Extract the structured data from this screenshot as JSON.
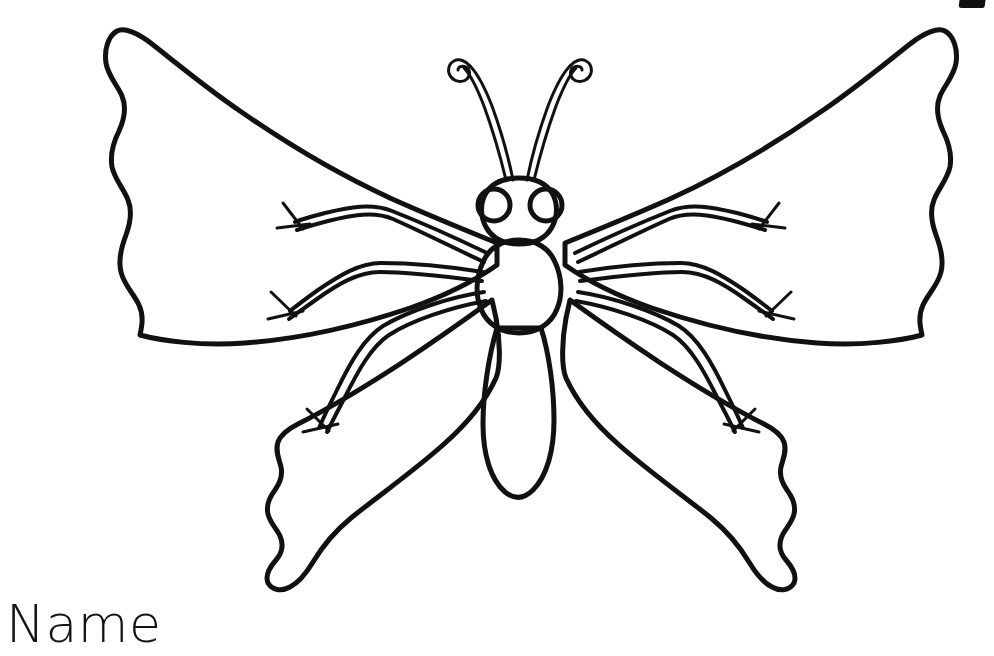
{
  "page": {
    "background_color": "#ffffff",
    "ink_color": "#111111",
    "width": 994,
    "height": 656,
    "kind": "coloring-page-line-art"
  },
  "artwork": {
    "subject": "butterfly",
    "title": "Butterfly Coloring Page Line Drawing",
    "style": "black outline on white, uncolored",
    "parts": [
      "left-upper-wing",
      "right-upper-wing",
      "left-lower-wing",
      "right-lower-wing",
      "head",
      "left-eye",
      "right-eye",
      "left-antenna",
      "right-antenna",
      "thorax",
      "abdomen",
      "left-legs",
      "right-legs"
    ],
    "stroke_widths": {
      "wing_outline": 5,
      "body_outline": 5,
      "antenna": 3,
      "leg": 3,
      "claw": 2.5
    }
  },
  "writing_line": {
    "label": "Name",
    "position": "bottom-left"
  },
  "corner_mark": {
    "name": "cropped-mark",
    "description": "small black glyph fragment clipped at top-right edge",
    "color": "#101010"
  }
}
